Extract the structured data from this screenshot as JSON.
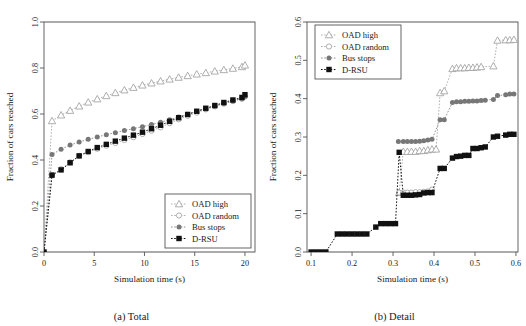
{
  "figure": {
    "panels": [
      {
        "id": "total",
        "caption": "(a) Total",
        "legend_position": "bottom-right"
      },
      {
        "id": "detail",
        "caption": "(b) Detail",
        "legend_position": "top-left"
      }
    ],
    "series_names": [
      "OAD high",
      "OAD random",
      "Bus stops",
      "D-RSU"
    ],
    "colors": {
      "oad_high": "#9a9a9a",
      "oad_random": "#9a9a9a",
      "bus_stops": "#777777",
      "d_rsu": "#111111",
      "axis": "#555555",
      "grid": "#dddddd"
    },
    "markers": {
      "oad_high": "triangle-open",
      "oad_random": "circle-open",
      "bus_stops": "circle-filled",
      "d_rsu": "square-filled"
    }
  },
  "chart_data": [
    {
      "type": "line",
      "title": "(a) Total",
      "xlabel": "Simulation time (s)",
      "ylabel": "Fraction of cars reached",
      "xlim": [
        0,
        21
      ],
      "ylim": [
        0.0,
        1.0
      ],
      "xticks": [
        0,
        5,
        10,
        15,
        20
      ],
      "yticks": [
        0.0,
        0.2,
        0.4,
        0.6,
        0.8,
        1.0
      ],
      "grid": false,
      "legend": [
        "OAD high",
        "OAD random",
        "Bus stops",
        "D-RSU"
      ],
      "legend_position": "bottom-right",
      "x": [
        0,
        0.8,
        1.7,
        2.6,
        3.5,
        4.4,
        5.3,
        6.2,
        7.1,
        8.0,
        8.9,
        9.8,
        10.7,
        11.6,
        12.5,
        13.4,
        14.3,
        15.2,
        16.1,
        17.0,
        17.9,
        18.8,
        19.7,
        20.0
      ],
      "series": [
        {
          "name": "OAD high",
          "marker": "triangle-open",
          "values": [
            0.0,
            0.57,
            0.595,
            0.615,
            0.634,
            0.651,
            0.665,
            0.679,
            0.692,
            0.704,
            0.715,
            0.725,
            0.734,
            0.743,
            0.751,
            0.759,
            0.766,
            0.773,
            0.779,
            0.786,
            0.792,
            0.798,
            0.805,
            0.812
          ]
        },
        {
          "name": "OAD random",
          "marker": "circle-open",
          "values": [
            0.0,
            0.335,
            0.36,
            0.39,
            0.418,
            0.434,
            0.449,
            0.462,
            0.474,
            0.487,
            0.499,
            0.513,
            0.527,
            0.542,
            0.56,
            0.577,
            0.592,
            0.606,
            0.62,
            0.633,
            0.645,
            0.656,
            0.666,
            0.676
          ]
        },
        {
          "name": "Bus stops",
          "marker": "circle-filled",
          "values": [
            0.0,
            0.424,
            0.447,
            0.465,
            0.478,
            0.49,
            0.5,
            0.51,
            0.519,
            0.528,
            0.536,
            0.545,
            0.554,
            0.564,
            0.575,
            0.587,
            0.599,
            0.611,
            0.622,
            0.634,
            0.646,
            0.657,
            0.667,
            0.676
          ]
        },
        {
          "name": "D-RSU",
          "marker": "square-filled",
          "values": [
            0.0,
            0.334,
            0.357,
            0.388,
            0.418,
            0.437,
            0.454,
            0.468,
            0.482,
            0.495,
            0.508,
            0.521,
            0.536,
            0.551,
            0.568,
            0.584,
            0.598,
            0.612,
            0.625,
            0.637,
            0.65,
            0.661,
            0.672,
            0.684
          ]
        }
      ]
    },
    {
      "type": "line",
      "title": "(b) Detail",
      "xlabel": "Simulation time (s)",
      "ylabel": "Fraction of cars reached",
      "xlim": [
        0.09,
        0.605
      ],
      "ylim": [
        0.0,
        0.6
      ],
      "xticks": [
        0.1,
        0.2,
        0.3,
        0.4,
        0.5,
        0.6
      ],
      "yticks": [
        0.0,
        0.1,
        0.2,
        0.3,
        0.4,
        0.5,
        0.6
      ],
      "grid": false,
      "legend": [
        "OAD high",
        "OAD random",
        "Bus stops",
        "D-RSU"
      ],
      "legend_position": "top-left",
      "series": [
        {
          "name": "OAD high",
          "marker": "triangle-open",
          "x": [
            0.315,
            0.325,
            0.335,
            0.345,
            0.355,
            0.365,
            0.375,
            0.385,
            0.395,
            0.405,
            0.415,
            0.425,
            0.445,
            0.455,
            0.465,
            0.475,
            0.485,
            0.495,
            0.505,
            0.515,
            0.545,
            0.555,
            0.575,
            0.585,
            0.595
          ],
          "values": [
            0.155,
            0.262,
            0.262,
            0.262,
            0.262,
            0.264,
            0.264,
            0.266,
            0.268,
            0.268,
            0.415,
            0.42,
            0.478,
            0.48,
            0.48,
            0.48,
            0.481,
            0.481,
            0.482,
            0.483,
            0.485,
            0.552,
            0.553,
            0.553,
            0.554
          ]
        },
        {
          "name": "OAD random",
          "marker": "circle-open",
          "x": [
            0.315,
            0.325,
            0.335,
            0.345,
            0.355,
            0.365,
            0.375,
            0.385,
            0.395
          ],
          "values": [
            0.155,
            0.155,
            0.155,
            0.155,
            0.156,
            0.156,
            0.157,
            0.158,
            0.163
          ]
        },
        {
          "name": "Bus stops",
          "marker": "circle-filled",
          "x": [
            0.313,
            0.325,
            0.335,
            0.345,
            0.355,
            0.365,
            0.375,
            0.385,
            0.395,
            0.415,
            0.425,
            0.445,
            0.455,
            0.465,
            0.475,
            0.485,
            0.495,
            0.505,
            0.515,
            0.525,
            0.545,
            0.555,
            0.575,
            0.585,
            0.595
          ],
          "values": [
            0.288,
            0.288,
            0.288,
            0.288,
            0.288,
            0.289,
            0.29,
            0.292,
            0.294,
            0.345,
            0.345,
            0.39,
            0.392,
            0.392,
            0.393,
            0.393,
            0.394,
            0.394,
            0.395,
            0.396,
            0.398,
            0.408,
            0.41,
            0.412,
            0.412
          ]
        },
        {
          "name": "D-RSU",
          "marker": "square-filled",
          "x": [
            0.1,
            0.112,
            0.124,
            0.136,
            0.164,
            0.176,
            0.188,
            0.2,
            0.212,
            0.224,
            0.236,
            0.258,
            0.27,
            0.282,
            0.294,
            0.306,
            0.315,
            0.325,
            0.335,
            0.345,
            0.355,
            0.365,
            0.375,
            0.385,
            0.395,
            0.415,
            0.425,
            0.445,
            0.455,
            0.465,
            0.475,
            0.485,
            0.495,
            0.505,
            0.515,
            0.525,
            0.545,
            0.555,
            0.575,
            0.585,
            0.595
          ],
          "values": [
            0.0,
            0.0,
            0.0,
            0.0,
            0.047,
            0.047,
            0.047,
            0.047,
            0.047,
            0.047,
            0.047,
            0.065,
            0.074,
            0.074,
            0.074,
            0.074,
            0.26,
            0.148,
            0.148,
            0.148,
            0.149,
            0.15,
            0.154,
            0.155,
            0.155,
            0.218,
            0.218,
            0.245,
            0.249,
            0.25,
            0.252,
            0.252,
            0.27,
            0.27,
            0.272,
            0.274,
            0.3,
            0.302,
            0.305,
            0.307,
            0.307
          ]
        }
      ]
    }
  ]
}
